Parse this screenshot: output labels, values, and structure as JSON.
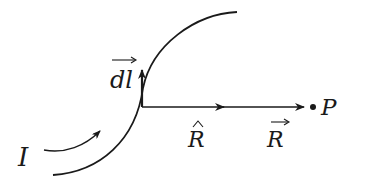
{
  "diagram": {
    "type": "biot-savart-current-element",
    "colors": {
      "stroke": "#1a1a1a",
      "background": "#ffffff"
    },
    "labels": {
      "current": "I",
      "dl": "dl",
      "r_hat": "R",
      "r_vec": "R",
      "point": "P"
    },
    "label_decorations": {
      "dl": "vector-arrow-overbar",
      "r_hat": "hat",
      "r_vec": "vector-arrow-overbar"
    },
    "elements": [
      {
        "name": "current-carrying-wire",
        "shape": "curve"
      },
      {
        "name": "current-direction-arrow",
        "shape": "curved-arrow"
      },
      {
        "name": "dl-vector-arrow",
        "shape": "arrow",
        "direction": "up"
      },
      {
        "name": "r-vector-arrow",
        "shape": "arrow",
        "direction": "right"
      },
      {
        "name": "point-p",
        "shape": "dot"
      }
    ]
  }
}
